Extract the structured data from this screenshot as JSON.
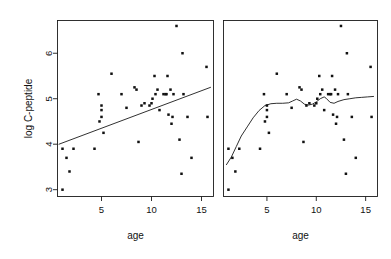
{
  "figure": {
    "width": 391,
    "height": 259,
    "background": "#ffffff",
    "foreground": "#111111"
  },
  "chart_data": [
    {
      "type": "scatter",
      "panel": "left",
      "title": "",
      "xlabel": "age",
      "ylabel": "log C-peptide",
      "xlim": [
        0.6,
        16.2
      ],
      "ylim": [
        2.85,
        6.72
      ],
      "xticks": [
        5,
        10,
        15
      ],
      "xticklabels": [
        "5",
        "10",
        "15"
      ],
      "yticks": [
        3,
        4,
        5,
        6
      ],
      "yticklabels": [
        "3",
        "4",
        "5",
        "6"
      ],
      "grid": false,
      "legend": null,
      "show_yaxis": true,
      "points": [
        [
          1.1,
          3.0
        ],
        [
          1.1,
          3.9
        ],
        [
          1.5,
          3.7
        ],
        [
          1.8,
          3.4
        ],
        [
          2.2,
          3.9
        ],
        [
          4.3,
          3.9
        ],
        [
          4.8,
          4.5
        ],
        [
          5.0,
          4.6
        ],
        [
          5.0,
          4.75
        ],
        [
          5.0,
          4.85
        ],
        [
          4.7,
          5.1
        ],
        [
          5.2,
          4.25
        ],
        [
          6.0,
          5.55
        ],
        [
          7.0,
          5.1
        ],
        [
          7.5,
          4.8
        ],
        [
          8.3,
          5.25
        ],
        [
          8.5,
          5.2
        ],
        [
          8.7,
          4.05
        ],
        [
          9.3,
          4.9
        ],
        [
          9.8,
          4.85
        ],
        [
          10.1,
          5.0
        ],
        [
          10.3,
          5.5
        ],
        [
          10.4,
          5.1
        ],
        [
          10.6,
          5.2
        ],
        [
          10.8,
          4.75
        ],
        [
          11.2,
          5.1
        ],
        [
          11.4,
          5.1
        ],
        [
          11.5,
          5.1
        ],
        [
          11.6,
          5.5
        ],
        [
          11.7,
          4.65
        ],
        [
          11.9,
          5.2
        ],
        [
          12.0,
          4.45
        ],
        [
          12.1,
          4.6
        ],
        [
          12.2,
          5.1
        ],
        [
          12.5,
          6.6
        ],
        [
          12.8,
          4.1
        ],
        [
          13.0,
          3.35
        ],
        [
          13.1,
          6.0
        ],
        [
          13.6,
          4.6
        ],
        [
          14.0,
          3.7
        ],
        [
          15.5,
          5.7
        ],
        [
          15.6,
          4.6
        ],
        [
          10.0,
          4.9
        ],
        [
          9.0,
          4.85
        ],
        [
          13.2,
          5.1
        ]
      ],
      "fit": {
        "kind": "linear",
        "label": "least-squares line",
        "endpoints": [
          [
            0.75,
            4.0
          ],
          [
            15.9,
            5.25
          ]
        ]
      }
    },
    {
      "type": "scatter",
      "panel": "right",
      "title": "",
      "xlabel": "age",
      "ylabel": "",
      "xlim": [
        0.6,
        16.2
      ],
      "ylim": [
        2.85,
        6.72
      ],
      "xticks": [
        5,
        10,
        15
      ],
      "xticklabels": [
        "5",
        "10",
        "15"
      ],
      "yticks": [
        3,
        4,
        5,
        6
      ],
      "yticklabels": [],
      "grid": false,
      "legend": null,
      "show_yaxis": false,
      "points": [
        [
          1.1,
          3.0
        ],
        [
          1.1,
          3.9
        ],
        [
          1.5,
          3.7
        ],
        [
          1.8,
          3.4
        ],
        [
          2.2,
          3.9
        ],
        [
          4.3,
          3.9
        ],
        [
          4.8,
          4.5
        ],
        [
          5.0,
          4.6
        ],
        [
          5.0,
          4.75
        ],
        [
          5.0,
          4.85
        ],
        [
          4.7,
          5.1
        ],
        [
          5.2,
          4.25
        ],
        [
          6.0,
          5.55
        ],
        [
          7.0,
          5.1
        ],
        [
          7.5,
          4.8
        ],
        [
          8.3,
          5.25
        ],
        [
          8.5,
          5.2
        ],
        [
          8.7,
          4.05
        ],
        [
          9.3,
          4.9
        ],
        [
          9.8,
          4.85
        ],
        [
          10.1,
          5.0
        ],
        [
          10.3,
          5.5
        ],
        [
          10.4,
          5.1
        ],
        [
          10.6,
          5.2
        ],
        [
          10.8,
          4.75
        ],
        [
          11.2,
          5.1
        ],
        [
          11.4,
          5.1
        ],
        [
          11.5,
          5.1
        ],
        [
          11.6,
          5.5
        ],
        [
          11.7,
          4.65
        ],
        [
          11.9,
          5.2
        ],
        [
          12.0,
          4.45
        ],
        [
          12.1,
          4.6
        ],
        [
          12.2,
          5.1
        ],
        [
          12.5,
          6.6
        ],
        [
          12.8,
          4.1
        ],
        [
          13.0,
          3.35
        ],
        [
          13.1,
          6.0
        ],
        [
          13.6,
          4.6
        ],
        [
          14.0,
          3.7
        ],
        [
          15.5,
          5.7
        ],
        [
          15.6,
          4.6
        ],
        [
          10.0,
          4.9
        ],
        [
          9.0,
          4.85
        ],
        [
          13.2,
          5.1
        ]
      ],
      "fit": {
        "kind": "smooth",
        "label": "scatterplot smoother",
        "path": [
          [
            0.9,
            3.55
          ],
          [
            1.4,
            3.72
          ],
          [
            1.9,
            3.95
          ],
          [
            2.4,
            4.18
          ],
          [
            3.0,
            4.38
          ],
          [
            3.6,
            4.58
          ],
          [
            4.2,
            4.74
          ],
          [
            4.8,
            4.85
          ],
          [
            5.4,
            4.89
          ],
          [
            6.0,
            4.9
          ],
          [
            6.6,
            4.9
          ],
          [
            7.2,
            4.91
          ],
          [
            7.6,
            4.95
          ],
          [
            8.0,
            4.99
          ],
          [
            8.4,
            4.95
          ],
          [
            8.8,
            4.88
          ],
          [
            9.2,
            4.86
          ],
          [
            9.6,
            4.88
          ],
          [
            10.0,
            4.93
          ],
          [
            10.4,
            5.0
          ],
          [
            10.8,
            5.04
          ],
          [
            11.0,
            5.01
          ],
          [
            11.4,
            4.92
          ],
          [
            11.8,
            4.9
          ],
          [
            12.2,
            4.94
          ],
          [
            12.8,
            4.98
          ],
          [
            13.4,
            5.0
          ],
          [
            14.0,
            5.02
          ],
          [
            14.6,
            5.03
          ],
          [
            15.2,
            5.04
          ],
          [
            15.8,
            5.05
          ]
        ]
      }
    }
  ]
}
